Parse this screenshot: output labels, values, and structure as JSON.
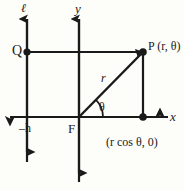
{
  "figure": {
    "background_color": "#fdfdfa",
    "stroke_color": "#1a1a1a",
    "labels": {
      "directrix_line": "ℓ",
      "y_axis": "y",
      "x_axis": "x",
      "point_q": "Q",
      "point_p": "P (r, θ)",
      "radius": "r",
      "angle": "θ",
      "directrix_distance": "–h",
      "focus": "F",
      "foot_point": "(r cos θ, 0)"
    },
    "geometry": {
      "focus_origin": {
        "x": 79,
        "y": 117
      },
      "point_p": {
        "x": 143,
        "y": 52
      },
      "point_q": {
        "x": 27,
        "y": 52
      },
      "foot_point": {
        "x": 143,
        "y": 117
      },
      "directrix_x": 27,
      "y_axis_x": 79,
      "x_axis_y": 117,
      "qp_line_y": 52
    }
  }
}
